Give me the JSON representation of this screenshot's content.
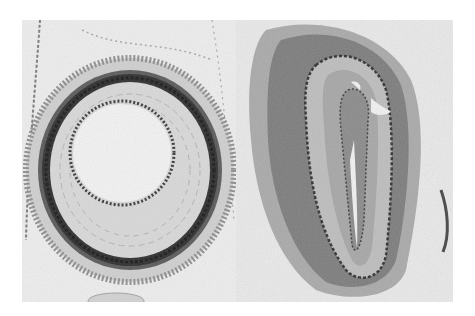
{
  "figure": {
    "type": "histology micrograph",
    "colors": {
      "background": "#ffffff",
      "tissue_light": "#e6e6e6",
      "tissue_mid": "#b8b8b8",
      "tissue_dark": "#2a2a2a"
    },
    "panels": [
      {
        "position": "left",
        "subject": "artery-cross-section"
      },
      {
        "position": "right",
        "subject": "collapsed-vessel-cross-section"
      }
    ]
  }
}
